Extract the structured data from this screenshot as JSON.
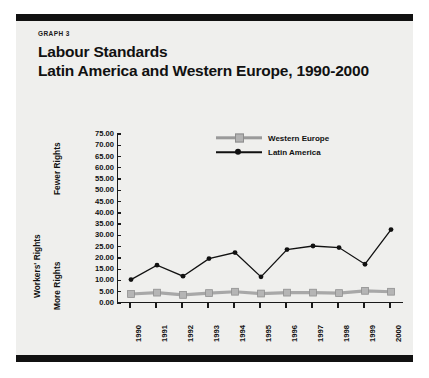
{
  "header": {
    "kicker": "GRAPH 3",
    "title_line1": "Labour Standards",
    "title_line2": "Latin America and Western Europe, 1990-2000"
  },
  "axis": {
    "y_group_label": "Workers' Rights",
    "y_top_label": "Fewer Rights",
    "y_bottom_label": "More Rights"
  },
  "legend": {
    "entries": [
      {
        "label": "Western Europe",
        "color": "#b3b3b3",
        "marker": "square"
      },
      {
        "label": "Latin America",
        "color": "#111111",
        "marker": "circle"
      }
    ]
  },
  "chart_data": {
    "type": "line",
    "xlabel": "",
    "ylabel": "Workers' Rights",
    "ylim": [
      0,
      75
    ],
    "ytick_step": 5,
    "grid": false,
    "legend_position": "top-right",
    "yticks": [
      "75.00",
      "70.00",
      "65.00",
      "60.00",
      "55.00",
      "50.00",
      "45.00",
      "40.00",
      "35.00",
      "30.00",
      "25.00",
      "20.00",
      "15.00",
      "10.00",
      "5.00",
      "0.00"
    ],
    "categories": [
      "1990",
      "1991",
      "1992",
      "1993",
      "1994",
      "1995",
      "1996",
      "1997",
      "1998",
      "1999",
      "2000"
    ],
    "series": [
      {
        "name": "Western Europe",
        "color": "#a8a8a8",
        "marker": "square",
        "values": [
          4.0,
          4.6,
          3.6,
          4.4,
          5.0,
          4.2,
          4.6,
          4.6,
          4.4,
          5.4,
          5.0
        ]
      },
      {
        "name": "Latin America",
        "color": "#111111",
        "marker": "circle",
        "values": [
          10.4,
          16.8,
          11.9,
          19.7,
          22.4,
          11.6,
          23.7,
          25.3,
          24.6,
          17.2,
          32.6
        ]
      }
    ]
  }
}
